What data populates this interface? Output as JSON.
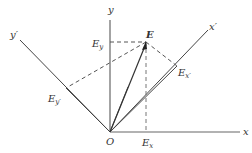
{
  "diagram": {
    "origin_label": "O",
    "axes": {
      "x": {
        "label": "x"
      },
      "y": {
        "label": "y"
      },
      "x_prime": {
        "label": "x",
        "prime": "′"
      },
      "y_prime": {
        "label": "y",
        "prime": "′"
      }
    },
    "vector": {
      "label": "E"
    },
    "components": {
      "Ex": {
        "base": "E",
        "sub": "x"
      },
      "Ey": {
        "base": "E",
        "sub": "y"
      },
      "Ex_prime": {
        "base": "E",
        "sub": "x′"
      },
      "Ey_prime": {
        "base": "E",
        "sub": "y′"
      }
    },
    "colors": {
      "axis": "#555555",
      "vector": "#333333",
      "dashed": "#555555",
      "text": "#333333"
    }
  }
}
